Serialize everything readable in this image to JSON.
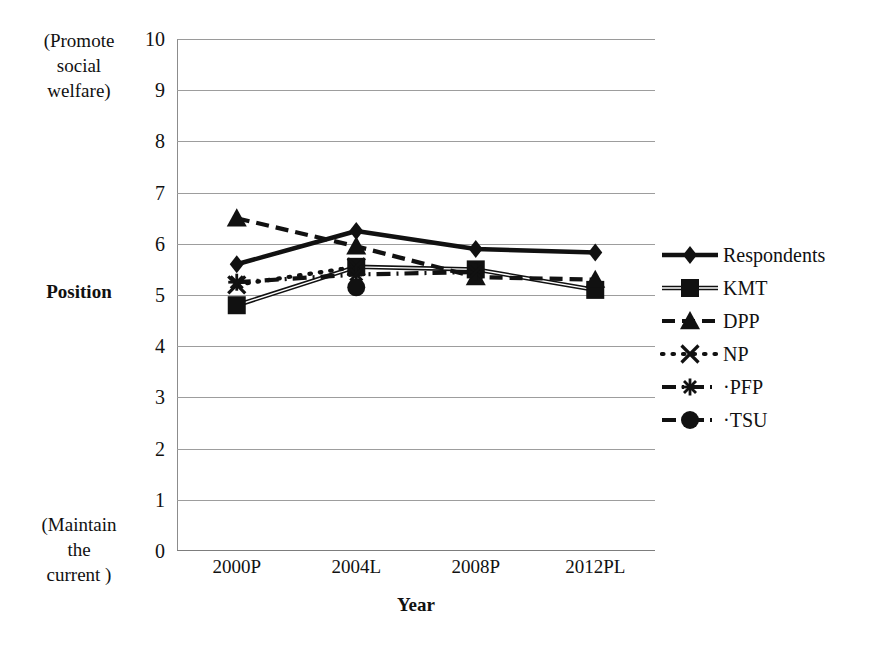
{
  "chart_data": {
    "type": "line",
    "title": "",
    "xlabel": "Year",
    "ylabel": "Position",
    "categories": [
      "2000P",
      "2004L",
      "2008P",
      "2012PL"
    ],
    "ylim": [
      0,
      10
    ],
    "yticks": [
      0,
      1,
      2,
      3,
      4,
      5,
      6,
      7,
      8,
      9,
      10
    ],
    "grid": true,
    "legend_position": "right",
    "y_axis_top_note": "(Promote social welfare)",
    "y_axis_bottom_note": "(Maintain the current )",
    "series": [
      {
        "name": "Respondents",
        "marker": "diamond",
        "line_style": "solid",
        "values": [
          5.6,
          6.25,
          5.9,
          5.83
        ]
      },
      {
        "name": "KMT",
        "marker": "square",
        "line_style": "solid",
        "values": [
          4.8,
          5.55,
          5.5,
          5.1
        ]
      },
      {
        "name": "DPP",
        "marker": "triangle",
        "line_style": "dashed",
        "values": [
          6.5,
          5.95,
          5.35,
          5.3
        ]
      },
      {
        "name": "NP",
        "marker": "x",
        "line_style": "dotted",
        "values": [
          5.2,
          5.55,
          null,
          null
        ]
      },
      {
        "name": "PFP",
        "marker": "asterisk",
        "line_style": "dash-dot",
        "values": [
          5.25,
          5.4,
          5.45,
          null
        ]
      },
      {
        "name": "TSU",
        "marker": "circle",
        "line_style": "dash-dot",
        "values": [
          null,
          5.15,
          null,
          null
        ]
      }
    ]
  },
  "axis": {
    "top_note_lines": [
      "(Promote",
      "social",
      "welfare)"
    ],
    "bottom_note_lines": [
      "(Maintain",
      "the",
      "current )"
    ],
    "y_title": "Position",
    "x_title": "Year",
    "ytick_labels": [
      "10",
      "9",
      "8",
      "7",
      "6",
      "5",
      "4",
      "3",
      "2",
      "1",
      "0"
    ],
    "xtick_labels": [
      "2000P",
      "2004L",
      "2008P",
      "2012PL"
    ]
  },
  "legend": {
    "items": [
      {
        "label": "Respondents",
        "marker": "diamond",
        "line_style": "solid"
      },
      {
        "label": "KMT",
        "marker": "square",
        "line_style": "solid"
      },
      {
        "label": "DPP",
        "marker": "triangle",
        "line_style": "dashed"
      },
      {
        "label": "NP",
        "marker": "x",
        "line_style": "dotted"
      },
      {
        "label": "·PFP",
        "marker": "asterisk",
        "line_style": "dash-dot"
      },
      {
        "label": "·TSU",
        "marker": "circle",
        "line_style": "dash-dot"
      }
    ]
  },
  "colors": {
    "ink": "#111111",
    "grid": "#9d9d9d",
    "axis": "#8c8c8c",
    "background": "#ffffff"
  }
}
